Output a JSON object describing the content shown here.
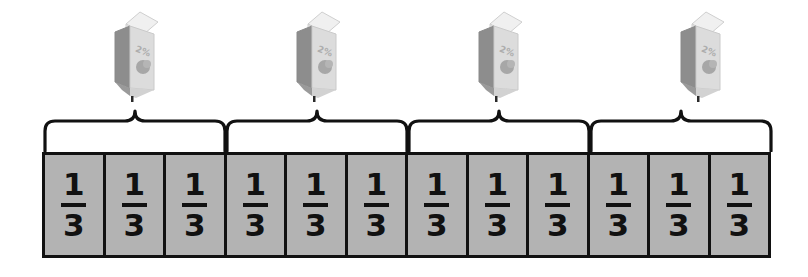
{
  "figure": {
    "type": "fraction-bar-diagram",
    "background_color": "#ffffff",
    "line_color": "#111111"
  },
  "fraction_bar": {
    "name": "fraction-bar",
    "total_cells": 12,
    "cell_fill_color": "#b3b3b3",
    "border_color": "#111111",
    "cells": [
      {
        "numerator": "1",
        "denominator": "3"
      },
      {
        "numerator": "1",
        "denominator": "3"
      },
      {
        "numerator": "1",
        "denominator": "3"
      },
      {
        "numerator": "1",
        "denominator": "3"
      },
      {
        "numerator": "1",
        "denominator": "3"
      },
      {
        "numerator": "1",
        "denominator": "3"
      },
      {
        "numerator": "1",
        "denominator": "3"
      },
      {
        "numerator": "1",
        "denominator": "3"
      },
      {
        "numerator": "1",
        "denominator": "3"
      },
      {
        "numerator": "1",
        "denominator": "3"
      },
      {
        "numerator": "1",
        "denominator": "3"
      },
      {
        "numerator": "1",
        "denominator": "3"
      }
    ]
  },
  "groups": [
    {
      "name": "group-1",
      "cells_spanned": 3,
      "brace_left": 42,
      "brace_width": 186,
      "carton_left": 106
    },
    {
      "name": "group-2",
      "cells_spanned": 3,
      "brace_left": 224,
      "brace_width": 186,
      "carton_left": 288
    },
    {
      "name": "group-3",
      "cells_spanned": 3,
      "brace_left": 406,
      "brace_width": 186,
      "carton_left": 470
    },
    {
      "name": "group-4",
      "cells_spanned": 3,
      "brace_left": 588,
      "brace_width": 186,
      "carton_left": 672
    }
  ],
  "cartons": [
    {
      "name": "milk-carton-1",
      "label": "2%"
    },
    {
      "name": "milk-carton-2",
      "label": "2%"
    },
    {
      "name": "milk-carton-3",
      "label": "2%"
    },
    {
      "name": "milk-carton-4",
      "label": "2%"
    }
  ],
  "colors": {
    "carton_side_dark": "#8d8d8d",
    "carton_front_light": "#dcdcdc",
    "carton_top_light": "#ededed",
    "carton_outline": "#bdbdbd",
    "tile_gray": "#b3b3b3",
    "ink": "#111111"
  }
}
